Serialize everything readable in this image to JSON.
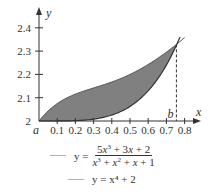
{
  "chart_data": {
    "type": "area",
    "title": "",
    "xlabel": "x",
    "ylabel": "y",
    "xlim": [
      0,
      0.85
    ],
    "ylim": [
      2,
      2.45
    ],
    "x_ticks": [
      0.1,
      0.2,
      0.3,
      0.4,
      0.5,
      0.6,
      0.7,
      0.8
    ],
    "x_tick_labels": [
      "0.1",
      "0.2",
      "0.3",
      "0.4",
      "0.5",
      "0.6",
      "0.7",
      "0.8"
    ],
    "y_ticks": [
      2,
      2.1,
      2.2,
      2.3,
      2.4
    ],
    "y_tick_labels": [
      "2",
      "2.1",
      "2.2",
      "2.3",
      "2.4"
    ],
    "grid": false,
    "legend_position": "bottom",
    "annotations": [
      {
        "text": "a",
        "x": 0,
        "y": 2,
        "note": "left bound of shaded region"
      },
      {
        "text": "b",
        "x": 0.755,
        "y": 2,
        "note": "right bound, intersection; dashed vertical line"
      }
    ],
    "shaded_region": {
      "between": [
        "f",
        "g"
      ],
      "x_from": 0,
      "x_to": 0.755,
      "color": "#808080"
    },
    "series": [
      {
        "name": "f",
        "label": "y = (5x^3 + 3x + 2) / (x^3 + x^2 + x + 1)",
        "x": [
          0,
          0.1,
          0.2,
          0.3,
          0.4,
          0.5,
          0.6,
          0.7,
          0.75,
          0.8
        ],
        "values": [
          2.0,
          2.075,
          2.115,
          2.142,
          2.168,
          2.2,
          2.243,
          2.296,
          2.326,
          2.358
        ]
      },
      {
        "name": "g",
        "label": "y = x^4 + 2",
        "x": [
          0,
          0.1,
          0.2,
          0.3,
          0.4,
          0.5,
          0.6,
          0.7,
          0.75,
          0.77
        ],
        "values": [
          2.0,
          2.0001,
          2.0016,
          2.0081,
          2.0256,
          2.0625,
          2.1296,
          2.2401,
          2.3164,
          2.3515
        ]
      }
    ]
  },
  "labels": {
    "x_axis": "x",
    "y_axis": "y",
    "a": "a",
    "b": "b"
  },
  "legend": {
    "line_color": "#b0b0b0",
    "f_prefix": "y =",
    "g_text": "y = x⁴ + 2"
  }
}
